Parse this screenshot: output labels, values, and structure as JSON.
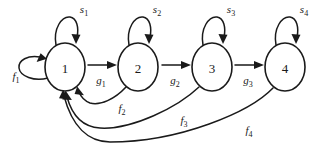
{
  "figure": {
    "type": "state-transition-diagram",
    "title": "",
    "background_color": "#ffffff",
    "stroke_color": "#1a1a1a",
    "width": 323,
    "height": 149
  },
  "nodes": [
    {
      "id": "state-1",
      "label": "1",
      "cx": 65,
      "cy": 67,
      "rx": 20,
      "ry": 24
    },
    {
      "id": "state-2",
      "label": "2",
      "cx": 138,
      "cy": 67,
      "rx": 20,
      "ry": 24
    },
    {
      "id": "state-3",
      "label": "3",
      "cx": 212,
      "cy": 67,
      "rx": 20,
      "ry": 24
    },
    {
      "id": "state-4",
      "label": "4",
      "cx": 285,
      "cy": 67,
      "rx": 20,
      "ry": 24
    }
  ],
  "self_loops": [
    {
      "id": "self-loop-1",
      "from": "state-1",
      "to": "state-1",
      "label_base": "s",
      "label_sub": "1",
      "label_x": 84,
      "label_y": 13
    },
    {
      "id": "self-loop-2",
      "from": "state-2",
      "to": "state-2",
      "label_base": "s",
      "label_sub": "2",
      "label_x": 157,
      "label_y": 13
    },
    {
      "id": "self-loop-3",
      "from": "state-3",
      "to": "state-3",
      "label_base": "s",
      "label_sub": "3",
      "label_x": 231,
      "label_y": 13
    },
    {
      "id": "self-loop-4",
      "from": "state-4",
      "to": "state-4",
      "label_base": "s",
      "label_sub": "4",
      "label_x": 304,
      "label_y": 13
    }
  ],
  "forward_edges": [
    {
      "id": "edge-g1",
      "from": "state-1",
      "to": "state-2",
      "label_base": "g",
      "label_sub": "1",
      "label_x": 101,
      "label_y": 84
    },
    {
      "id": "edge-g2",
      "from": "state-2",
      "to": "state-3",
      "label_base": "g",
      "label_sub": "2",
      "label_x": 175,
      "label_y": 84
    },
    {
      "id": "edge-g3",
      "from": "state-3",
      "to": "state-4",
      "label_base": "g",
      "label_sub": "3",
      "label_x": 248,
      "label_y": 84
    }
  ],
  "feedback_edges": [
    {
      "id": "edge-f1",
      "from": "state-1",
      "to": "state-1",
      "label_base": "f",
      "label_sub": "1",
      "label_x": 16,
      "label_y": 80
    },
    {
      "id": "edge-f2",
      "from": "state-2",
      "to": "state-1",
      "label_base": "f",
      "label_sub": "2",
      "label_x": 122,
      "label_y": 112
    },
    {
      "id": "edge-f3",
      "from": "state-3",
      "to": "state-1",
      "label_base": "f",
      "label_sub": "3",
      "label_x": 184,
      "label_y": 124
    },
    {
      "id": "edge-f4",
      "from": "state-4",
      "to": "state-1",
      "label_base": "f",
      "label_sub": "4",
      "label_x": 249,
      "label_y": 134
    }
  ]
}
